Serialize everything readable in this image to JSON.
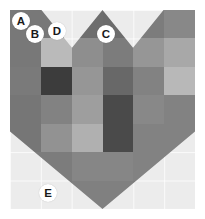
{
  "figure": {
    "title": "",
    "background_color": "#ececec",
    "border_color": "#ffffff",
    "grid_visible": true,
    "grid_line_color": "#ffffff"
  },
  "chart_data": {
    "type": "heatmap",
    "title": "",
    "subtitle": "",
    "xlabel": "",
    "ylabel": "",
    "colormap": "grays",
    "shape_mask": "heart",
    "columns": 6,
    "rows": 7,
    "x_tick_labels": [
      "",
      "",
      "",
      "",
      "",
      ""
    ],
    "y_tick_labels": [
      "",
      "",
      "",
      "",
      "",
      "",
      ""
    ],
    "legend_position": "none",
    "value_range": [
      0,
      255
    ],
    "values": [
      [
        120,
        120,
        110,
        108,
        124,
        136
      ],
      [
        120,
        186,
        142,
        124,
        150,
        168
      ],
      [
        122,
        60,
        150,
        104,
        130,
        184
      ],
      [
        118,
        130,
        158,
        74,
        136,
        130
      ],
      [
        118,
        146,
        176,
        74,
        130,
        130
      ],
      [
        124,
        124,
        134,
        134,
        130,
        130
      ],
      [
        124,
        124,
        128,
        128,
        126,
        126
      ]
    ],
    "cell_colors": [
      [
        "#787878",
        "#787878",
        "#6e6e6e",
        "#6c6c6c",
        "#7c7c7c",
        "#888888"
      ],
      [
        "#787878",
        "#bababa",
        "#8e8e8e",
        "#7c7c7c",
        "#969696",
        "#a8a8a8"
      ],
      [
        "#7a7a7a",
        "#3c3c3c",
        "#969696",
        "#686868",
        "#828282",
        "#b8b8b8"
      ],
      [
        "#767676",
        "#828282",
        "#9e9e9e",
        "#4a4a4a",
        "#888888",
        "#828282"
      ],
      [
        "#767676",
        "#929292",
        "#b0b0b0",
        "#4a4a4a",
        "#828282",
        "#828282"
      ],
      [
        "#7c7c7c",
        "#7c7c7c",
        "#868686",
        "#868686",
        "#828282",
        "#828282"
      ],
      [
        "#7c7c7c",
        "#7c7c7c",
        "#808080",
        "#808080",
        "#7e7e7e",
        "#7e7e7e"
      ]
    ]
  },
  "annotations": {
    "markers": [
      {
        "id": "marker-a",
        "label": "A",
        "x": 12,
        "y": 12
      },
      {
        "id": "marker-b",
        "label": "B",
        "x": 26,
        "y": 25
      },
      {
        "id": "marker-c",
        "label": "C",
        "x": 97,
        "y": 25
      },
      {
        "id": "marker-d",
        "label": "D",
        "x": 48,
        "y": 22
      },
      {
        "id": "marker-e",
        "label": "E",
        "x": 39,
        "y": 184
      }
    ]
  }
}
